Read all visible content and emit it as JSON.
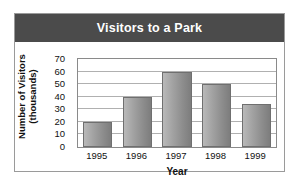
{
  "card": {
    "title": "Visitors to a Park"
  },
  "chart_data": {
    "type": "bar",
    "title": "Visitors to a Park",
    "xlabel": "Year",
    "ylabel": "Number of Visitors (thousands)",
    "ylabel_lines": [
      "Number of Visitors",
      "(thousands)"
    ],
    "categories": [
      "1995",
      "1996",
      "1997",
      "1998",
      "1999"
    ],
    "values": [
      20,
      40,
      60,
      50,
      34
    ],
    "yticks": [
      0,
      10,
      20,
      30,
      40,
      50,
      60,
      70
    ],
    "ylim": [
      0,
      70
    ],
    "grid": true,
    "legend": false,
    "bar_color": "#9a9a9a",
    "title_bar_color": "#4b4b4b",
    "title_text_color": "#ffffff"
  }
}
